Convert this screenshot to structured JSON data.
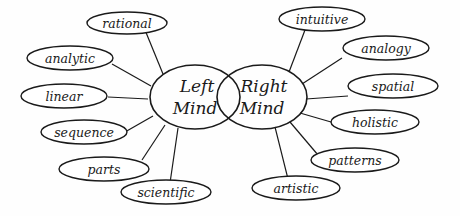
{
  "diagram": {
    "hubs": {
      "left": {
        "line1": "Left",
        "line2": "Mind"
      },
      "right": {
        "line1": "Right",
        "line2": "Mind"
      }
    },
    "left_labels": [
      {
        "text": "rational"
      },
      {
        "text": "analytic"
      },
      {
        "text": "linear"
      },
      {
        "text": "sequence"
      },
      {
        "text": "parts"
      },
      {
        "text": "scientific"
      }
    ],
    "right_labels": [
      {
        "text": "intuitive"
      },
      {
        "text": "analogy"
      },
      {
        "text": "spatial"
      },
      {
        "text": "holistic"
      },
      {
        "text": "patterns"
      },
      {
        "text": "artistic"
      }
    ],
    "colors": {
      "ink": "#1a1a1a",
      "paper": "#fefefe"
    }
  }
}
